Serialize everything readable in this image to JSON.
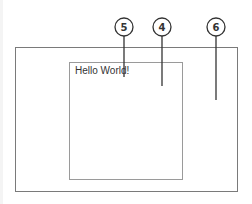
{
  "diagram": {
    "outer_window": {
      "label": "outer container"
    },
    "inner_panel": {
      "text": "Hello World!"
    },
    "callouts": [
      {
        "number": "5",
        "target": "text cursor in inner panel"
      },
      {
        "number": "4",
        "target": "inner panel"
      },
      {
        "number": "6",
        "target": "outer container"
      }
    ]
  },
  "colors": {
    "outline": "#7a7a7a",
    "inner_outline": "#9a9a9a",
    "callout": "#333333",
    "background": "#ffffff"
  }
}
